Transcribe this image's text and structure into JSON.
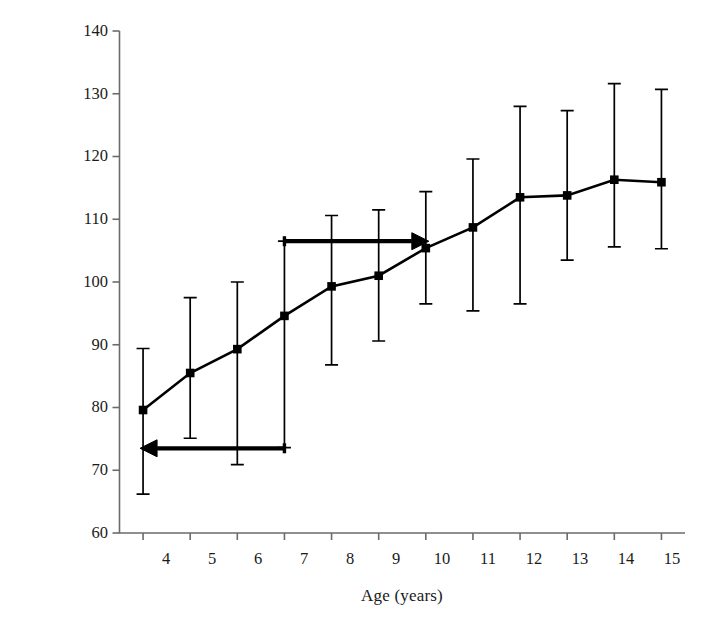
{
  "chart_data": {
    "type": "line",
    "title": "",
    "subtitle": "",
    "xlabel": "Age (years)",
    "ylabel": "Working memory performance",
    "x": [
      4,
      5,
      6,
      7,
      8,
      9,
      10,
      11,
      12,
      13,
      14,
      15
    ],
    "xtick_labels": [
      "4",
      "5",
      "6",
      "7",
      "8",
      "9",
      "10",
      "11",
      "12",
      "13",
      "14",
      "15"
    ],
    "ytick_labels": [
      "140",
      "130",
      "120",
      "110",
      "100",
      "90",
      "80",
      "70",
      "60"
    ],
    "yticks": [
      140,
      130,
      120,
      110,
      100,
      90,
      80,
      70,
      60
    ],
    "xlim": [
      3.5,
      15.5
    ],
    "ylim": [
      60,
      140
    ],
    "grid": false,
    "legend": "none",
    "series": [
      {
        "name": "Working memory performance",
        "marker": "filled-square",
        "color": "#000000",
        "values": [
          79.6,
          85.5,
          89.3,
          94.6,
          99.3,
          101.0,
          105.4,
          108.7,
          113.5,
          113.8,
          116.3,
          115.9
        ],
        "error_low": [
          66.2,
          75.1,
          70.9,
          73.6,
          86.8,
          90.6,
          96.5,
          95.4,
          96.5,
          103.5,
          105.6,
          105.3
        ],
        "error_high": [
          89.4,
          97.5,
          100.0,
          106.5,
          110.6,
          111.5,
          114.4,
          119.6,
          128.0,
          127.3,
          131.6,
          130.7
        ]
      }
    ],
    "annotations": [
      {
        "name": "upper-arrow",
        "type": "arrow",
        "direction": "right",
        "x_start": 7,
        "x_end": 10,
        "y": 106.5
      },
      {
        "name": "lower-arrow",
        "type": "arrow",
        "direction": "left",
        "x_start": 7,
        "x_end": 4,
        "y": 73.5
      }
    ]
  }
}
